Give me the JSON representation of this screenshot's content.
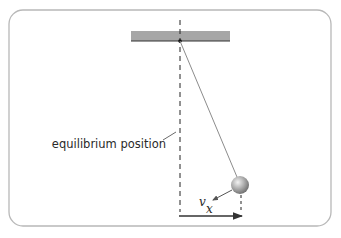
{
  "diagram": {
    "labels": {
      "equilibrium": "equilibrium position",
      "velocity": "v",
      "displacement": "x"
    },
    "colors": {
      "frame": "#b8b8b8",
      "support": "#a6a6a6",
      "support_edge": "#333333",
      "rod": "#8c8c8c",
      "dashed": "#222222",
      "arrow": "#333333",
      "bob_light": "#e0e0e0",
      "bob_dark": "#777777"
    },
    "geometry": {
      "pivot": [
        180,
        41
      ],
      "bob_center": [
        240,
        185
      ],
      "bob_radius": 9
    }
  }
}
